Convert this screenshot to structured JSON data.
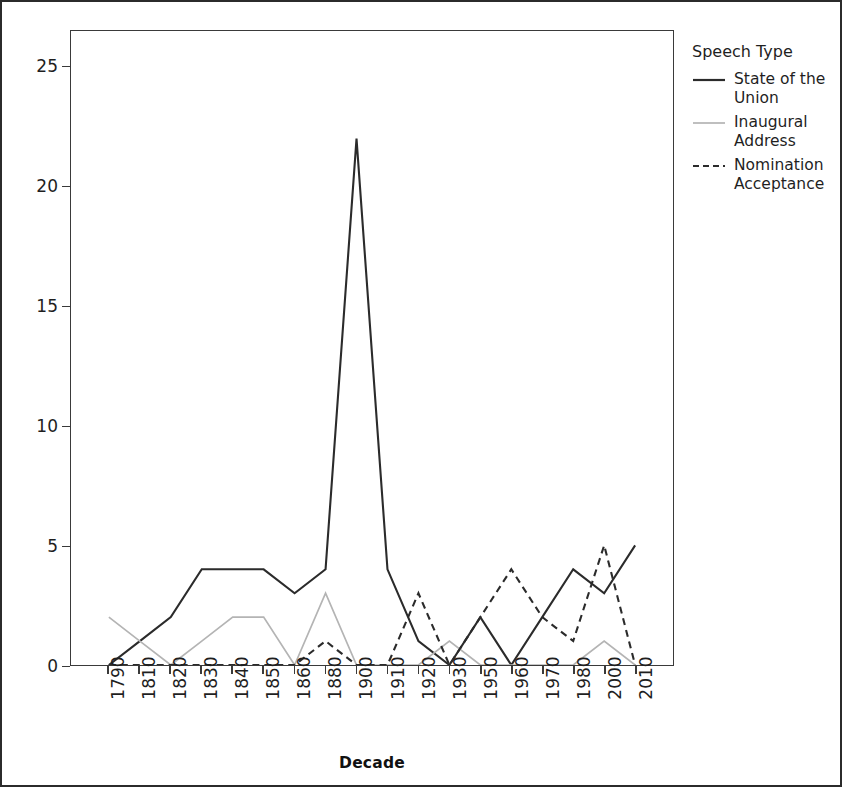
{
  "chart_data": {
    "type": "line",
    "title": "",
    "xlabel": "Decade",
    "ylabel": "",
    "grid": false,
    "legend_position": "right",
    "legend_title": "Speech Type",
    "categories": [
      "1790",
      "1810",
      "1820",
      "1830",
      "1840",
      "1850",
      "1860",
      "1880",
      "1900",
      "1910",
      "1920",
      "1930",
      "1950",
      "1960",
      "1970",
      "1980",
      "2000",
      "2010"
    ],
    "xlim": [
      0,
      17
    ],
    "ylim": [
      0,
      26.5
    ],
    "yticks": [
      0,
      5,
      10,
      15,
      20,
      25
    ],
    "series": [
      {
        "name": "State of the Union",
        "style": "solid",
        "color": "#2b2b2b",
        "values": [
          0,
          1,
          2,
          4,
          4,
          4,
          3,
          4,
          22,
          4,
          1,
          0,
          2,
          0,
          2,
          4,
          3,
          5
        ]
      },
      {
        "name": "Inaugural Address",
        "style": "solid-light",
        "color": "#b4b4b4",
        "values": [
          2,
          1,
          0,
          1,
          2,
          2,
          0,
          3,
          0,
          0,
          0,
          1,
          0,
          0,
          0,
          0,
          1,
          0
        ]
      },
      {
        "name": "Nomination Acceptance",
        "style": "dashed",
        "color": "#2b2b2b",
        "values": [
          0,
          0,
          0,
          0,
          0,
          0,
          0,
          1,
          0,
          0,
          3,
          0,
          2,
          4,
          2,
          1,
          5,
          0
        ]
      }
    ]
  },
  "axes": {
    "x_title": "Decade",
    "x_tick_labels": [
      "1790",
      "1810",
      "1820",
      "1830",
      "1840",
      "1850",
      "1860",
      "1880",
      "1900",
      "1910",
      "1920",
      "1930",
      "1950",
      "1960",
      "1970",
      "1980",
      "2000",
      "2010"
    ],
    "y_tick_labels": [
      "25",
      "20",
      "15",
      "10",
      "5",
      "0"
    ]
  },
  "legend": {
    "title": "Speech Type",
    "items": [
      {
        "label": "State of the\nUnion",
        "style": "solid",
        "color": "#2b2b2b"
      },
      {
        "label": "Inaugural\nAddress",
        "style": "solid-light",
        "color": "#b4b4b4"
      },
      {
        "label": "Nomination\nAcceptance",
        "style": "dashed",
        "color": "#2b2b2b"
      }
    ]
  }
}
